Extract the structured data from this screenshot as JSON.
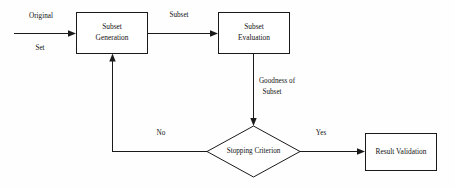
{
  "diagram": {
    "background_color": "#fefefe",
    "line_color": "#1a1a1a",
    "text_color": "#121212",
    "nodes": [
      {
        "id": "subset-generation",
        "label_line1": "Subset",
        "label_line2": "Generation",
        "shape": "rectangle"
      },
      {
        "id": "subset-evaluation",
        "label_line1": "Subset",
        "label_line2": "Evaluation",
        "shape": "rectangle"
      },
      {
        "id": "stopping-criterion",
        "label": "Stopping Criterion",
        "shape": "diamond"
      },
      {
        "id": "result-validation",
        "label": "Result Validation",
        "shape": "rectangle"
      }
    ],
    "edge_labels": {
      "original_line1": "Original",
      "original_line2": "Set",
      "subset": "Subset",
      "goodness_line1": "Goodness of",
      "goodness_line2": "Subset",
      "no": "No",
      "yes": "Yes"
    }
  }
}
